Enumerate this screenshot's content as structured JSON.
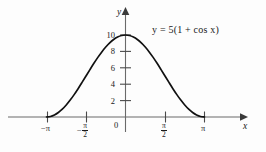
{
  "chart_data": {
    "type": "line",
    "title": "",
    "equation_label": "y = 5(1 + cos x)",
    "equation_parts": {
      "lhs": "y",
      "equals": "=",
      "rhs": "5(1 + cos x)"
    },
    "xlabel": "x",
    "ylabel": "y",
    "xlim": [
      -4.2,
      4.6
    ],
    "ylim": [
      -1.4,
      12.2
    ],
    "grid": false,
    "legend": "none",
    "x_ticks": [
      {
        "value": -3.14159,
        "label": "−π",
        "type": "plain"
      },
      {
        "value": -1.5708,
        "label": "−π/2",
        "type": "fraction",
        "sign": "−",
        "numerator": "π",
        "denominator": "2"
      },
      {
        "value": 0,
        "label": "0",
        "type": "plain"
      },
      {
        "value": 1.5708,
        "label": "π/2",
        "type": "fraction",
        "sign": "",
        "numerator": "π",
        "denominator": "2"
      },
      {
        "value": 3.14159,
        "label": "π",
        "type": "plain"
      }
    ],
    "y_ticks": [
      {
        "value": 0,
        "label": "0"
      },
      {
        "value": 2,
        "label": "2"
      },
      {
        "value": 4,
        "label": "4"
      },
      {
        "value": 6,
        "label": "6"
      },
      {
        "value": 8,
        "label": "8"
      },
      {
        "value": 10,
        "label": "10"
      }
    ],
    "series": [
      {
        "name": "y = 5(1 + cos x)",
        "color": "#111111",
        "x": [
          -3.14159,
          -2.98451,
          -2.82743,
          -2.67035,
          -2.51327,
          -2.35619,
          -2.19911,
          -2.04204,
          -1.88496,
          -1.72788,
          -1.5708,
          -1.41372,
          -1.25664,
          -1.09956,
          -0.94248,
          -0.7854,
          -0.62832,
          -0.47124,
          -0.31416,
          -0.15708,
          0,
          0.15708,
          0.31416,
          0.47124,
          0.62832,
          0.7854,
          0.94248,
          1.09956,
          1.25664,
          1.41372,
          1.5708,
          1.72788,
          1.88496,
          2.04204,
          2.19911,
          2.35619,
          2.51327,
          2.67035,
          2.82743,
          2.98451,
          3.14159
        ],
        "y": [
          0.0,
          0.0616,
          0.2447,
          0.545,
          0.9549,
          1.4645,
          2.0611,
          2.73,
          3.4549,
          4.2178,
          5.0,
          5.7822,
          6.5451,
          7.27,
          7.9389,
          8.5355,
          9.0451,
          9.455,
          9.7553,
          9.9384,
          10.0,
          9.9384,
          9.7553,
          9.455,
          9.0451,
          8.5355,
          7.9389,
          7.27,
          6.5451,
          5.7822,
          5.0,
          4.2178,
          3.4549,
          2.73,
          2.0611,
          1.4645,
          0.9549,
          0.545,
          0.2447,
          0.0616,
          0.0
        ]
      }
    ],
    "annotations": [
      {
        "text": "y = 5(1 + cos x)",
        "x": 1.1,
        "y": 10.2,
        "role": "curve-equation"
      }
    ],
    "axis_arrows": {
      "x_right": true,
      "y_up": true
    },
    "peak": {
      "x": 0,
      "y": 10
    },
    "zeros": [
      -3.14159,
      3.14159
    ]
  },
  "colors": {
    "curve": "#111111",
    "axis": "#555555",
    "text": "#1a1a1a",
    "background": "#fdfdfd"
  }
}
